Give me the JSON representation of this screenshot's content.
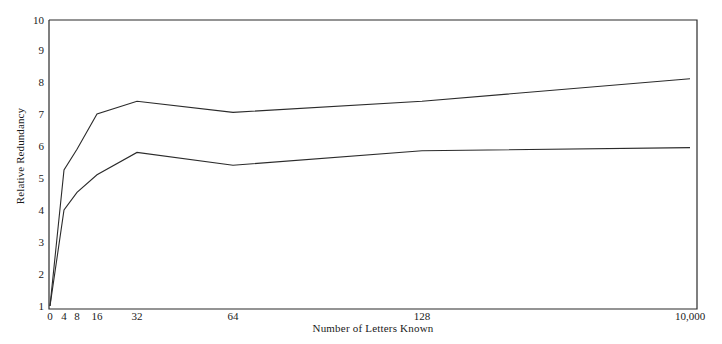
{
  "chart_data": {
    "type": "line",
    "title": "",
    "subtitle": "",
    "xlabel": "Number of Letters Known",
    "ylabel": "Relative Redundancy",
    "categories": [
      "0",
      "4",
      "8",
      "16",
      "32",
      "64",
      "128",
      "10,000"
    ],
    "x_tick_labels": [
      "0",
      "4",
      "8",
      "16",
      "32",
      "64",
      "128",
      "10,000"
    ],
    "y_tick_labels": [
      "1",
      "2",
      "3",
      "4",
      "5",
      "6",
      "7",
      "8",
      "9",
      "10"
    ],
    "ylim": [
      1,
      10
    ],
    "grid": false,
    "legend": "none",
    "axis_style": "box-frame",
    "line_color": "#2b2b2b",
    "background_color": "#ffffff",
    "series": [
      {
        "name": "upper",
        "values": [
          1.0,
          5.25,
          5.9,
          7.0,
          7.4,
          7.05,
          7.4,
          8.1
        ]
      },
      {
        "name": "lower",
        "values": [
          1.0,
          4.0,
          4.55,
          5.1,
          5.8,
          5.4,
          5.85,
          5.95
        ]
      }
    ],
    "annotations": []
  }
}
